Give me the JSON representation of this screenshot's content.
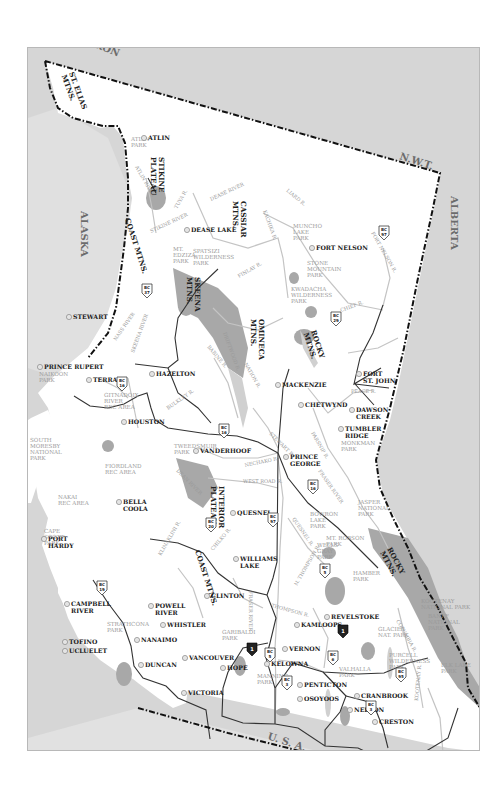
{
  "map": {
    "title": "British Columbia",
    "colors": {
      "land_bc": "#ffffff",
      "land_other": "#dcdcdc",
      "water": "#cfcfcf",
      "park": "#a9a9a9",
      "border": "#111111",
      "road": "#333333",
      "river": "#c8c8c8",
      "region_label": "#6c6c6c",
      "park_label": "#9a9a9a"
    },
    "regions": [
      {
        "id": "yukon",
        "label": "YUKON",
        "x": 58,
        "y": 20,
        "rot": 22
      },
      {
        "id": "nwt",
        "label": "N.W.T.",
        "x": 378,
        "y": 138,
        "rot": 18
      },
      {
        "id": "alberta",
        "label": "ALBERTA",
        "x": 430,
        "y": 175,
        "rot": 90
      },
      {
        "id": "alaska",
        "label": "ALASKA",
        "x": 60,
        "y": 190,
        "rot": 90
      },
      {
        "id": "usa",
        "label": "U. S. A.",
        "x": 246,
        "y": 718,
        "rot": 18
      }
    ],
    "ranges": [
      {
        "label": [
          "ST. ELIAS",
          "MTNS."
        ],
        "x": 68,
        "y": 72,
        "rot": 70
      },
      {
        "label": [
          "STIKINE",
          "PLATEAU"
        ],
        "x": 158,
        "y": 156,
        "rot": 90
      },
      {
        "label": [
          "CASSIAR",
          "MTNS."
        ],
        "x": 240,
        "y": 200,
        "rot": 90
      },
      {
        "label": [
          "COAST MTNS."
        ],
        "x": 124,
        "y": 218,
        "rot": 72
      },
      {
        "label": [
          "SKEENA",
          "MTNS."
        ],
        "x": 194,
        "y": 276,
        "rot": 90
      },
      {
        "label": [
          "OMINECA",
          "MTNS."
        ],
        "x": 258,
        "y": 318,
        "rot": 90
      },
      {
        "label": [
          "ROCKY",
          "MTNS."
        ],
        "x": 310,
        "y": 330,
        "rot": 72
      },
      {
        "label": [
          "INTERIOR",
          "PLATEAU"
        ],
        "x": 218,
        "y": 485,
        "rot": 90
      },
      {
        "label": [
          "COAST MTNS."
        ],
        "x": 194,
        "y": 550,
        "rot": 72
      },
      {
        "label": [
          "ROCKY",
          "MTNS."
        ],
        "x": 386,
        "y": 548,
        "rot": 62
      }
    ],
    "cities": [
      {
        "name": "ATLIN",
        "x": 143,
        "y": 131,
        "lx": 147,
        "ly": 139,
        "lines": [
          "ATLIN"
        ]
      },
      {
        "name": "DEASE LAKE",
        "x": 190,
        "y": 221,
        "lx": 190,
        "ly": 231,
        "lines": [
          "DEASE LAKE"
        ]
      },
      {
        "name": "FORT NELSON",
        "x": 355,
        "y": 257,
        "lx": 315,
        "ly": 249,
        "lines": [
          "FORT NELSON"
        ]
      },
      {
        "name": "STEWART",
        "x": 107,
        "y": 316,
        "lx": 72,
        "ly": 318,
        "lines": [
          "STEWART"
        ]
      },
      {
        "name": "PRINCE RUPERT",
        "x": 46,
        "y": 348,
        "lx": 43,
        "ly": 368,
        "lines": [
          "PRINCE RUPERT"
        ]
      },
      {
        "name": "TERRACE",
        "x": 96,
        "y": 356,
        "lx": 92,
        "ly": 381,
        "lines": [
          "TERRACE"
        ]
      },
      {
        "name": "HAZELTON",
        "x": 119,
        "y": 345,
        "lx": 155,
        "ly": 375,
        "lines": [
          "HAZELTON"
        ]
      },
      {
        "name": "HOUSTON",
        "x": 127,
        "y": 372,
        "lx": 127,
        "ly": 423,
        "lines": [
          "HOUSTON"
        ]
      },
      {
        "name": "MACKENZIE",
        "x": 261,
        "y": 321,
        "lx": 281,
        "ly": 386,
        "lines": [
          "MACKENZIE"
        ]
      },
      {
        "name": "FORT ST. JOHN",
        "x": 353,
        "y": 320,
        "lx": 362,
        "ly": 375,
        "lines": [
          "FORT",
          "ST. JOHN"
        ]
      },
      {
        "name": "CHETWYND",
        "x": 327,
        "y": 336,
        "lx": 304,
        "ly": 406,
        "lines": [
          "CHETWYND"
        ]
      },
      {
        "name": "DAWSON CREEK",
        "x": 361,
        "y": 340,
        "lx": 355,
        "ly": 411,
        "lines": [
          "DAWSON",
          "CREEK"
        ]
      },
      {
        "name": "TUMBLER RIDGE",
        "x": 346,
        "y": 357,
        "lx": 344,
        "ly": 430,
        "lines": [
          "TUMBLER",
          "RIDGE"
        ]
      },
      {
        "name": "VANDERHOOF",
        "x": 209,
        "y": 388,
        "lx": 199,
        "ly": 452,
        "lines": [
          "VANDERHOOF"
        ]
      },
      {
        "name": "PRINCE GEORGE",
        "x": 250,
        "y": 405,
        "lx": 289,
        "ly": 458,
        "lines": [
          "PRINCE",
          "GEORGE"
        ]
      },
      {
        "name": "BELLA COOLA",
        "x": 122,
        "y": 491,
        "lx": 122,
        "ly": 503,
        "lines": [
          "BELLA",
          "COOLA"
        ]
      },
      {
        "name": "QUESNEL",
        "x": 249,
        "y": 514,
        "lx": 236,
        "ly": 514,
        "lines": [
          "QUESNEL"
        ]
      },
      {
        "name": "WILLIAMS LAKE",
        "x": 239,
        "y": 547,
        "lx": 239,
        "ly": 560,
        "lines": [
          "WILLIAMS",
          "LAKE"
        ]
      },
      {
        "name": "PORT HARDY",
        "x": 65,
        "y": 532,
        "lx": 47,
        "ly": 540,
        "lines": [
          "PORT",
          "HARDY"
        ]
      },
      {
        "name": "CLINTON",
        "x": 242,
        "y": 595,
        "lx": 210,
        "ly": 597,
        "lines": [
          "CLINTON"
        ]
      },
      {
        "name": "CAMPBELL RIVER",
        "x": 106,
        "y": 618,
        "lx": 70,
        "ly": 605,
        "lines": [
          "CAMPBELL",
          "RIVER"
        ]
      },
      {
        "name": "POWELL RIVER",
        "x": 148,
        "y": 610,
        "lx": 154,
        "ly": 607,
        "lines": [
          "POWELL",
          "RIVER"
        ]
      },
      {
        "name": "WHISTLER",
        "x": 200,
        "y": 624,
        "lx": 166,
        "ly": 626,
        "lines": [
          "WHISTLER"
        ]
      },
      {
        "name": "NANAIMO",
        "x": 138,
        "y": 638,
        "lx": 140,
        "ly": 641,
        "lines": [
          "NANAIMO"
        ]
      },
      {
        "name": "TOFINO",
        "x": 95,
        "y": 641,
        "lx": 68,
        "ly": 643,
        "lines": [
          "TOFINO"
        ]
      },
      {
        "name": "UCLUELET",
        "x": 103,
        "y": 650,
        "lx": 68,
        "ly": 652,
        "lines": [
          "UCLUELET"
        ]
      },
      {
        "name": "DUNCAN",
        "x": 178,
        "y": 662,
        "lx": 144,
        "ly": 666,
        "lines": [
          "DUNCAN"
        ]
      },
      {
        "name": "VANCOUVER",
        "x": 194,
        "y": 668,
        "lx": 188,
        "ly": 659,
        "lines": [
          "VANCOUVER"
        ]
      },
      {
        "name": "VICTORIA",
        "x": 182,
        "y": 691,
        "lx": 187,
        "ly": 694,
        "lines": [
          "VICTORIA"
        ]
      },
      {
        "name": "HOPE",
        "x": 247,
        "y": 676,
        "lx": 226,
        "ly": 669,
        "lines": [
          "HOPE"
        ]
      },
      {
        "name": "KAMLOOPS",
        "x": 295,
        "y": 624,
        "lx": 300,
        "ly": 626,
        "lines": [
          "KAMLOOPS"
        ]
      },
      {
        "name": "REVELSTOKE",
        "x": 356,
        "y": 625,
        "lx": 330,
        "ly": 618,
        "lines": [
          "REVELSTOKE"
        ]
      },
      {
        "name": "VERNON",
        "x": 318,
        "y": 648,
        "lx": 288,
        "ly": 650,
        "lines": [
          "VERNON"
        ]
      },
      {
        "name": "KELOWNA",
        "x": 312,
        "y": 664,
        "lx": 270,
        "ly": 665,
        "lines": [
          "KELOWNA"
        ]
      },
      {
        "name": "PENTICTON",
        "x": 297,
        "y": 682,
        "lx": 303,
        "ly": 686,
        "lines": [
          "PENTICTON"
        ]
      },
      {
        "name": "OSOYOOS",
        "x": 297,
        "y": 698,
        "lx": 303,
        "ly": 700,
        "lines": [
          "OSOYOOS"
        ]
      },
      {
        "name": "CRANBROOK",
        "x": 400,
        "y": 702,
        "lx": 360,
        "ly": 697,
        "lines": [
          "CRANBROOK"
        ]
      },
      {
        "name": "NELSON",
        "x": 355,
        "y": 712,
        "lx": 353,
        "ly": 711,
        "lines": [
          "NELSON"
        ]
      },
      {
        "name": "CRESTON",
        "x": 372,
        "y": 718,
        "lx": 378,
        "ly": 723,
        "lines": [
          "CRESTON"
        ]
      }
    ],
    "parks": [
      {
        "lines": [
          "ATLIN",
          "PARK"
        ],
        "x": 130,
        "y": 140
      },
      {
        "lines": [
          "MT.",
          "EDZIZA",
          "PARK"
        ],
        "x": 172,
        "y": 250
      },
      {
        "lines": [
          "SPATSIZI",
          "WILDERNESS",
          "PARK"
        ],
        "x": 192,
        "y": 252
      },
      {
        "lines": [
          "MUNCHO",
          "LAKE",
          "PARK"
        ],
        "x": 292,
        "y": 227
      },
      {
        "lines": [
          "STONE",
          "MOUNTAIN",
          "PARK"
        ],
        "x": 306,
        "y": 264
      },
      {
        "lines": [
          "KWADACHA",
          "WILDERNESS",
          "PARK"
        ],
        "x": 290,
        "y": 290
      },
      {
        "lines": [
          "NAIKOON",
          "PARK"
        ],
        "x": 38,
        "y": 375
      },
      {
        "lines": [
          "GITNADOIX",
          "RIVER",
          "REC AREA"
        ],
        "x": 103,
        "y": 396
      },
      {
        "lines": [
          "SOUTH",
          "MORESBY",
          "NATIONAL",
          "PARK"
        ],
        "x": 29,
        "y": 441
      },
      {
        "lines": [
          "TWEEDSMUIR",
          "PARK"
        ],
        "x": 173,
        "y": 447
      },
      {
        "lines": [
          "FIORDLAND",
          "REC AREA"
        ],
        "x": 104,
        "y": 467
      },
      {
        "lines": [
          "NAKAI",
          "REC AREA"
        ],
        "x": 57,
        "y": 498
      },
      {
        "lines": [
          "CAPE",
          "SCOTT",
          "PARK"
        ],
        "x": 43,
        "y": 532
      },
      {
        "lines": [
          "MONKMAN",
          "PARK"
        ],
        "x": 340,
        "y": 444
      },
      {
        "lines": [
          "JASPER",
          "NATIONAL",
          "PARK"
        ],
        "x": 357,
        "y": 503
      },
      {
        "lines": [
          "BOWRON",
          "LAKE",
          "PARK"
        ],
        "x": 309,
        "y": 515
      },
      {
        "lines": [
          "MT. ROBSON",
          "PARK"
        ],
        "x": 325,
        "y": 539
      },
      {
        "lines": [
          "WELLS",
          "GRAY",
          "PARK"
        ],
        "x": 316,
        "y": 546
      },
      {
        "lines": [
          "HAMBER",
          "PARK"
        ],
        "x": 352,
        "y": 574
      },
      {
        "lines": [
          "STRATHCONA",
          "PARK"
        ],
        "x": 106,
        "y": 625
      },
      {
        "lines": [
          "GARIBALDI",
          "PARK"
        ],
        "x": 221,
        "y": 633
      },
      {
        "lines": [
          "GLACIER",
          "NAT. PARK"
        ],
        "x": 377,
        "y": 630
      },
      {
        "lines": [
          "KOOTENAY",
          "NATIONAL PARK"
        ],
        "x": 420,
        "y": 602
      },
      {
        "lines": [
          "BANFF",
          "NATIONAL",
          "PARK"
        ],
        "x": 427,
        "y": 617
      },
      {
        "lines": [
          "PURCELL",
          "WILDERNESS",
          "PARK"
        ],
        "x": 388,
        "y": 656
      },
      {
        "lines": [
          "VALHALLA",
          "PARK"
        ],
        "x": 338,
        "y": 670
      },
      {
        "lines": [
          "MANNING",
          "PARK"
        ],
        "x": 256,
        "y": 677
      },
      {
        "lines": [
          "ELK LAKE",
          "PARK"
        ],
        "x": 440,
        "y": 666
      }
    ],
    "rivers": [
      {
        "label": "ATLIN RIVER",
        "x": 134,
        "y": 166,
        "rot": 60
      },
      {
        "label": "DEASE RIVER",
        "x": 210,
        "y": 200,
        "rot": -25
      },
      {
        "label": "KACHIKA R.",
        "x": 262,
        "y": 210,
        "rot": 70
      },
      {
        "label": "LIARD R.",
        "x": 285,
        "y": 190,
        "rot": 40
      },
      {
        "label": "FORT NELSON R.",
        "x": 370,
        "y": 232,
        "rot": 60
      },
      {
        "label": "TUYA R.",
        "x": 176,
        "y": 208,
        "rot": -60
      },
      {
        "label": "STIKINE RIVER",
        "x": 150,
        "y": 232,
        "rot": -25
      },
      {
        "label": "FINLAY R.",
        "x": 238,
        "y": 277,
        "rot": -30
      },
      {
        "label": "CHIEF R.",
        "x": 340,
        "y": 311,
        "rot": -20
      },
      {
        "label": "NASS RIVER",
        "x": 115,
        "y": 340,
        "rot": -55
      },
      {
        "label": "SKEENA RIVER",
        "x": 133,
        "y": 352,
        "rot": -70
      },
      {
        "label": "DRIFTWOOD R.",
        "x": 222,
        "y": 332,
        "rot": 70
      },
      {
        "label": "BABINE R.",
        "x": 206,
        "y": 346,
        "rot": 50
      },
      {
        "label": "NATION R.",
        "x": 243,
        "y": 363,
        "rot": 60
      },
      {
        "label": "BULKLEY R.",
        "x": 167,
        "y": 409,
        "rot": -35
      },
      {
        "label": "PEACE R.",
        "x": 350,
        "y": 392,
        "rot": 0
      },
      {
        "label": "PARSNIP R.",
        "x": 310,
        "y": 432,
        "rot": 60
      },
      {
        "label": "STEWART R.",
        "x": 268,
        "y": 433,
        "rot": 45
      },
      {
        "label": "NECHAKO R.",
        "x": 244,
        "y": 466,
        "rot": -12
      },
      {
        "label": "WEST ROAD R.",
        "x": 242,
        "y": 482,
        "rot": 0
      },
      {
        "label": "FRASER RIVER",
        "x": 317,
        "y": 470,
        "rot": 55
      },
      {
        "label": "QUESNEL R.",
        "x": 291,
        "y": 518,
        "rot": 55
      },
      {
        "label": "DEAN RIVER",
        "x": 175,
        "y": 470,
        "rot": 45
      },
      {
        "label": "KLINAKLINI R.",
        "x": 160,
        "y": 555,
        "rot": -60
      },
      {
        "label": "CHILKO R.",
        "x": 212,
        "y": 550,
        "rot": -50
      },
      {
        "label": "FRASER RIVER",
        "x": 248,
        "y": 590,
        "rot": 90
      },
      {
        "label": "N. THOMPSON R.",
        "x": 296,
        "y": 585,
        "rot": -60
      },
      {
        "label": "THOMPSON R.",
        "x": 270,
        "y": 606,
        "rot": 15
      },
      {
        "label": "COLUMBIA R.",
        "x": 395,
        "y": 620,
        "rot": 60
      },
      {
        "label": "KOOTENAY R.",
        "x": 417,
        "y": 700,
        "rot": -85
      }
    ],
    "highways": [
      {
        "type": "bc",
        "line1": "BC",
        "line2": "37",
        "x": 146,
        "y": 290
      },
      {
        "type": "bc",
        "line1": "BC",
        "line2": "97",
        "x": 383,
        "y": 232
      },
      {
        "type": "bc",
        "line1": "BC",
        "line2": "29",
        "x": 335,
        "y": 318
      },
      {
        "type": "bc",
        "line1": "BC",
        "line2": "16",
        "x": 121,
        "y": 383
      },
      {
        "type": "bc",
        "line1": "BC",
        "line2": "16",
        "x": 223,
        "y": 430
      },
      {
        "type": "bc",
        "line1": "BC",
        "line2": "16",
        "x": 312,
        "y": 486
      },
      {
        "type": "bc",
        "line1": "BC",
        "line2": "20",
        "x": 210,
        "y": 524
      },
      {
        "type": "bc",
        "line1": "BC",
        "line2": "97",
        "x": 272,
        "y": 519
      },
      {
        "type": "bc",
        "line1": "BC",
        "line2": "5",
        "x": 324,
        "y": 570
      },
      {
        "type": "bc",
        "line1": "BC",
        "line2": "19",
        "x": 101,
        "y": 587
      },
      {
        "type": "bc",
        "line1": "BC",
        "line2": "5",
        "x": 269,
        "y": 654
      },
      {
        "type": "bc",
        "line1": "BC",
        "line2": "6",
        "x": 332,
        "y": 657
      },
      {
        "type": "bc",
        "line1": "BC",
        "line2": "3",
        "x": 286,
        "y": 682
      },
      {
        "type": "bc",
        "line1": "BC",
        "line2": "95",
        "x": 400,
        "y": 674
      },
      {
        "type": "bc",
        "line1": "BC",
        "line2": "3",
        "x": 370,
        "y": 707
      },
      {
        "type": "tch",
        "line1": "1",
        "x": 251,
        "y": 648
      },
      {
        "type": "tch",
        "line1": "1",
        "x": 342,
        "y": 630
      }
    ]
  }
}
